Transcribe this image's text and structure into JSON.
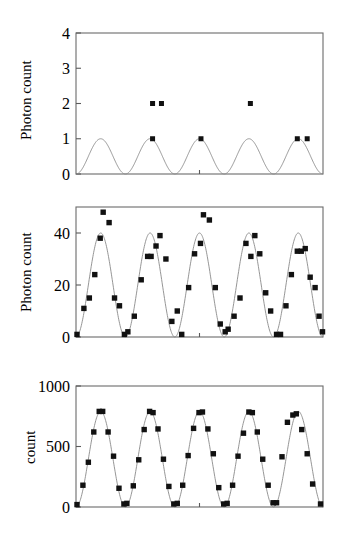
{
  "figure": {
    "background": "#ffffff",
    "marker_color": "#111111",
    "curve_color": "#8a8a8a",
    "axis_color": "#6b6b6b",
    "panel_count": 3
  },
  "chart_data": [
    {
      "type": "scatter",
      "panel": "top",
      "title": "",
      "xlabel": "",
      "ylabel": "Photon count",
      "ylim": [
        0,
        4
      ],
      "yticks": [
        0,
        1,
        2,
        3,
        4
      ],
      "ytick_labels": [
        "0",
        "1",
        "2",
        "3",
        "4"
      ],
      "xlim": [
        0,
        5
      ],
      "xticks": [
        2.5
      ],
      "xtick_labels": [
        ""
      ],
      "grid": false,
      "legend": "none",
      "fit_curve": {
        "form": "sine_squared",
        "amplitude": 1.0,
        "offset": 0.0,
        "cycles": 5,
        "phase_deg": 0
      },
      "points": [
        {
          "x": 1.55,
          "y": 2
        },
        {
          "x": 1.73,
          "y": 2
        },
        {
          "x": 3.53,
          "y": 2
        },
        {
          "x": 1.55,
          "y": 1
        },
        {
          "x": 2.53,
          "y": 1
        },
        {
          "x": 4.48,
          "y": 1
        },
        {
          "x": 4.68,
          "y": 1
        }
      ]
    },
    {
      "type": "scatter",
      "panel": "middle",
      "title": "",
      "xlabel": "",
      "ylabel": "Photon count",
      "ylim": [
        0,
        50
      ],
      "yticks": [
        0,
        20,
        40
      ],
      "ytick_labels": [
        "0",
        "20",
        "40"
      ],
      "xlim": [
        0,
        5
      ],
      "xticks": [
        2.5
      ],
      "xtick_labels": [
        ""
      ],
      "grid": false,
      "legend": "none",
      "fit_curve": {
        "form": "sine_squared",
        "amplitude": 40.0,
        "offset": 0.0,
        "cycles": 5,
        "phase_deg": 0
      },
      "points": [
        {
          "x": 0.02,
          "y": 1
        },
        {
          "x": 0.16,
          "y": 11
        },
        {
          "x": 0.27,
          "y": 15
        },
        {
          "x": 0.38,
          "y": 24
        },
        {
          "x": 0.49,
          "y": 38
        },
        {
          "x": 0.55,
          "y": 48
        },
        {
          "x": 0.67,
          "y": 44
        },
        {
          "x": 0.78,
          "y": 15
        },
        {
          "x": 0.88,
          "y": 12
        },
        {
          "x": 0.98,
          "y": 1
        },
        {
          "x": 1.05,
          "y": 2
        },
        {
          "x": 1.18,
          "y": 8
        },
        {
          "x": 1.32,
          "y": 22
        },
        {
          "x": 1.45,
          "y": 31
        },
        {
          "x": 1.52,
          "y": 31
        },
        {
          "x": 1.62,
          "y": 35
        },
        {
          "x": 1.7,
          "y": 39
        },
        {
          "x": 1.82,
          "y": 30
        },
        {
          "x": 1.94,
          "y": 6
        },
        {
          "x": 2.05,
          "y": 10
        },
        {
          "x": 2.14,
          "y": 1
        },
        {
          "x": 2.28,
          "y": 19
        },
        {
          "x": 2.4,
          "y": 32
        },
        {
          "x": 2.52,
          "y": 36
        },
        {
          "x": 2.58,
          "y": 47
        },
        {
          "x": 2.7,
          "y": 45
        },
        {
          "x": 2.82,
          "y": 19
        },
        {
          "x": 2.92,
          "y": 5
        },
        {
          "x": 3.02,
          "y": 2
        },
        {
          "x": 3.08,
          "y": 3
        },
        {
          "x": 3.2,
          "y": 8
        },
        {
          "x": 3.32,
          "y": 15
        },
        {
          "x": 3.44,
          "y": 36
        },
        {
          "x": 3.54,
          "y": 31
        },
        {
          "x": 3.62,
          "y": 39
        },
        {
          "x": 3.72,
          "y": 32
        },
        {
          "x": 3.84,
          "y": 17
        },
        {
          "x": 3.94,
          "y": 10
        },
        {
          "x": 4.06,
          "y": 1
        },
        {
          "x": 4.14,
          "y": 1
        },
        {
          "x": 4.25,
          "y": 12
        },
        {
          "x": 4.36,
          "y": 24
        },
        {
          "x": 4.48,
          "y": 33
        },
        {
          "x": 4.56,
          "y": 33
        },
        {
          "x": 4.64,
          "y": 34
        },
        {
          "x": 4.74,
          "y": 23
        },
        {
          "x": 4.84,
          "y": 19
        },
        {
          "x": 4.92,
          "y": 8
        },
        {
          "x": 4.99,
          "y": 2
        }
      ]
    },
    {
      "type": "scatter",
      "panel": "bottom",
      "title": "",
      "xlabel": "",
      "ylabel": "count",
      "ylim": [
        0,
        1000
      ],
      "yticks": [
        0,
        500,
        1000
      ],
      "ytick_labels": [
        "0",
        "500",
        "1000"
      ],
      "xlim": [
        0,
        5
      ],
      "xticks": [
        2.5
      ],
      "xtick_labels": [
        ""
      ],
      "grid": false,
      "legend": "none",
      "fit_curve": {
        "form": "sine_squared",
        "amplitude": 790.0,
        "offset": 0.0,
        "cycles": 5,
        "phase_deg": 0
      },
      "points": [
        {
          "x": 0.02,
          "y": 20
        },
        {
          "x": 0.14,
          "y": 180
        },
        {
          "x": 0.25,
          "y": 370
        },
        {
          "x": 0.36,
          "y": 620
        },
        {
          "x": 0.47,
          "y": 790
        },
        {
          "x": 0.54,
          "y": 790
        },
        {
          "x": 0.65,
          "y": 620
        },
        {
          "x": 0.76,
          "y": 420
        },
        {
          "x": 0.87,
          "y": 155
        },
        {
          "x": 0.97,
          "y": 25
        },
        {
          "x": 1.03,
          "y": 30
        },
        {
          "x": 1.16,
          "y": 175
        },
        {
          "x": 1.27,
          "y": 390
        },
        {
          "x": 1.38,
          "y": 640
        },
        {
          "x": 1.49,
          "y": 790
        },
        {
          "x": 1.56,
          "y": 780
        },
        {
          "x": 1.66,
          "y": 645
        },
        {
          "x": 1.77,
          "y": 395
        },
        {
          "x": 1.88,
          "y": 170
        },
        {
          "x": 1.98,
          "y": 25
        },
        {
          "x": 2.05,
          "y": 30
        },
        {
          "x": 2.16,
          "y": 180
        },
        {
          "x": 2.27,
          "y": 425
        },
        {
          "x": 2.38,
          "y": 650
        },
        {
          "x": 2.49,
          "y": 780
        },
        {
          "x": 2.56,
          "y": 785
        },
        {
          "x": 2.67,
          "y": 645
        },
        {
          "x": 2.78,
          "y": 440
        },
        {
          "x": 2.89,
          "y": 160
        },
        {
          "x": 2.99,
          "y": 25
        },
        {
          "x": 3.06,
          "y": 30
        },
        {
          "x": 3.17,
          "y": 180
        },
        {
          "x": 3.28,
          "y": 420
        },
        {
          "x": 3.39,
          "y": 610
        },
        {
          "x": 3.5,
          "y": 785
        },
        {
          "x": 3.57,
          "y": 780
        },
        {
          "x": 3.67,
          "y": 620
        },
        {
          "x": 3.78,
          "y": 395
        },
        {
          "x": 3.89,
          "y": 180
        },
        {
          "x": 3.99,
          "y": 35
        },
        {
          "x": 4.06,
          "y": 35
        },
        {
          "x": 4.17,
          "y": 415
        },
        {
          "x": 4.28,
          "y": 700
        },
        {
          "x": 4.39,
          "y": 760
        },
        {
          "x": 4.46,
          "y": 770
        },
        {
          "x": 4.57,
          "y": 640
        },
        {
          "x": 4.68,
          "y": 440
        },
        {
          "x": 4.79,
          "y": 190
        },
        {
          "x": 4.95,
          "y": 25
        }
      ]
    }
  ]
}
